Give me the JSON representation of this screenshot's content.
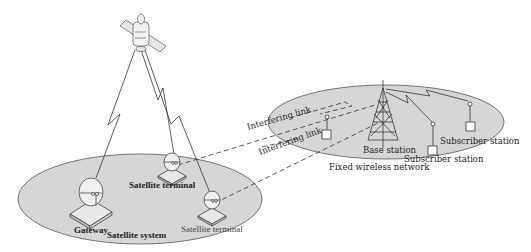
{
  "diagram": {
    "colors": {
      "ellipse_fill": "#d6d6d6",
      "ellipse_stroke": "#555555",
      "line": "#333333",
      "background": "#ffffff"
    },
    "satellite_system": {
      "label": "Satellite system",
      "nodes": {
        "gateway": "Gateway",
        "terminal_1": "Satellite terminal",
        "terminal_2": "Satellite terminal"
      }
    },
    "fixed_wireless_network": {
      "label": "Fixed wireless network",
      "nodes": {
        "base_station": "Base station",
        "subscriber_1": "Subscriber station",
        "subscriber_2": "Subscriber station"
      }
    },
    "links": {
      "interfering_1": "Interfering link",
      "interfering_2": "Interfering link"
    }
  }
}
